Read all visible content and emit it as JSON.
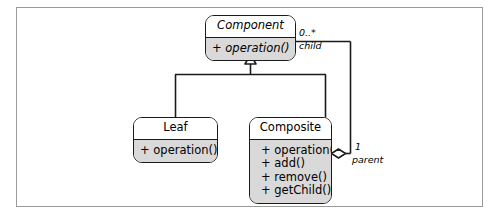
{
  "diagram": {
    "frame": {
      "border_color": "#9a9a9a",
      "background": "#ffffff"
    },
    "style": {
      "line_color": "#1b1b1b",
      "compartment_fill": "#d9d9d9",
      "title_fill": "#ffffff"
    },
    "classes": [
      {
        "id": "component",
        "name": "Component",
        "abstract": true,
        "operations": [
          "+ operation()"
        ]
      },
      {
        "id": "leaf",
        "name": "Leaf",
        "abstract": false,
        "operations": [
          "+ operation()"
        ]
      },
      {
        "id": "composite",
        "name": "Composite",
        "abstract": false,
        "operations": [
          "+ operation()",
          "+ add()",
          "+ remove()",
          "+ getChild()"
        ]
      }
    ],
    "relations": [
      {
        "id": "generalization-leaf",
        "type": "generalization",
        "from": "leaf",
        "to": "component"
      },
      {
        "id": "generalization-composite",
        "type": "generalization",
        "from": "composite",
        "to": "component"
      },
      {
        "id": "aggregation-children",
        "type": "aggregation",
        "from": "composite",
        "to": "component",
        "source_multiplicity": "1",
        "source_role": "parent",
        "target_multiplicity": "0..*",
        "target_role": "child"
      }
    ],
    "labels": {
      "child_multiplicity": "0..*",
      "child_role": "child",
      "parent_multiplicity": "1",
      "parent_role": "parent"
    }
  }
}
